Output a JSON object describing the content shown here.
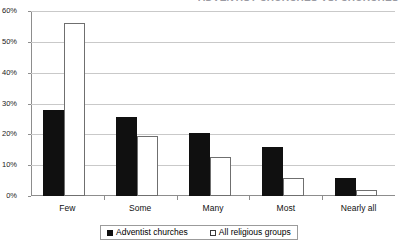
{
  "title_sliver": "ADVENTIST CHURCHES VS. CHURCHES",
  "chart_data": {
    "type": "bar",
    "title": "",
    "xlabel": "",
    "ylabel": "",
    "categories": [
      "Few",
      "Some",
      "Many",
      "Most",
      "Nearly all"
    ],
    "series": [
      {
        "name": "Adventist churches",
        "swatch": "filled-square",
        "color": "#101010",
        "values": [
          28,
          25.5,
          20.5,
          16,
          6
        ]
      },
      {
        "name": "All religious groups",
        "swatch": "open-square",
        "color": "#ffffff",
        "values": [
          56,
          19.5,
          12.5,
          6,
          2
        ]
      }
    ],
    "ylim": [
      0,
      60
    ],
    "yticks": [
      0,
      10,
      20,
      30,
      40,
      50,
      60
    ],
    "ytick_labels": [
      "0%",
      "10%",
      "20%",
      "30%",
      "40%",
      "50%",
      "60%"
    ],
    "grid": true,
    "legend_position": "bottom-center"
  },
  "legend": {
    "entries": [
      {
        "label": "Adventist churches"
      },
      {
        "label": "All religious groups"
      }
    ]
  }
}
